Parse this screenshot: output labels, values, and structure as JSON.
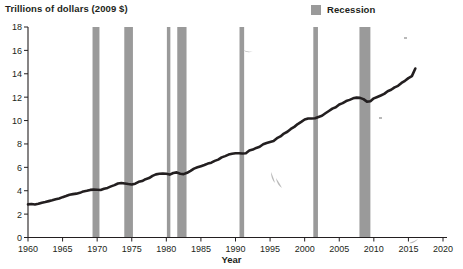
{
  "chart_data": {
    "type": "line",
    "title": "Trillions of dollars (2009 $)",
    "ylabel": "Trillions of dollars (2009 $)",
    "xlabel": "Year",
    "xlim": [
      1960,
      2020
    ],
    "ylim": [
      0,
      18
    ],
    "ytick_labels": [
      "0",
      "2",
      "4",
      "6",
      "8",
      "10",
      "12",
      "14",
      "16",
      "18"
    ],
    "yticks": [
      0,
      2,
      4,
      6,
      8,
      10,
      12,
      14,
      16,
      18
    ],
    "xtick_labels": [
      "1960",
      "1965",
      "1970",
      "1975",
      "1980",
      "1985",
      "1990",
      "1995",
      "2000",
      "2005",
      "2010",
      "2015",
      "2020"
    ],
    "xticks": [
      1960,
      1965,
      1970,
      1975,
      1980,
      1985,
      1990,
      1995,
      2000,
      2005,
      2010,
      2015,
      2020
    ],
    "grid": false,
    "legend_position": "top-right",
    "legend": [
      {
        "label": "Recession",
        "color": "#9a9a9a",
        "marker": "square"
      }
    ],
    "series": [
      {
        "name": "Real GDP",
        "color": "#231f20",
        "x": [
          1960,
          1960.5,
          1961,
          1961.5,
          1962,
          1962.5,
          1963,
          1963.5,
          1964,
          1964.5,
          1965,
          1965.5,
          1966,
          1966.5,
          1967,
          1967.5,
          1968,
          1968.5,
          1969,
          1969.5,
          1970,
          1970.5,
          1971,
          1971.5,
          1972,
          1972.5,
          1973,
          1973.5,
          1974,
          1974.5,
          1975,
          1975.5,
          1976,
          1976.5,
          1977,
          1977.5,
          1978,
          1978.5,
          1979,
          1979.5,
          1980,
          1980.5,
          1981,
          1981.5,
          1982,
          1982.5,
          1983,
          1983.5,
          1984,
          1984.5,
          1985,
          1985.5,
          1986,
          1986.5,
          1987,
          1987.5,
          1988,
          1988.5,
          1989,
          1989.5,
          1990,
          1990.5,
          1991,
          1991.5,
          1992,
          1992.5,
          1993,
          1993.5,
          1994,
          1994.5,
          1995,
          1995.5,
          1996,
          1996.5,
          1997,
          1997.5,
          1998,
          1998.5,
          1999,
          1999.5,
          2000,
          2000.5,
          2001,
          2001.5,
          2002,
          2002.5,
          2003,
          2003.5,
          2004,
          2004.5,
          2005,
          2005.5,
          2006,
          2006.5,
          2007,
          2007.5,
          2008,
          2008.5,
          2009,
          2009.5,
          2010,
          2010.5,
          2011,
          2011.5,
          2012,
          2012.5,
          2013,
          2013.5,
          2014,
          2014.5,
          2015,
          2015.5,
          2016
        ],
        "y": [
          2.83,
          2.86,
          2.82,
          2.88,
          2.98,
          3.04,
          3.11,
          3.18,
          3.27,
          3.34,
          3.45,
          3.55,
          3.66,
          3.71,
          3.75,
          3.82,
          3.94,
          4.0,
          4.07,
          4.09,
          4.08,
          4.06,
          4.17,
          4.24,
          4.37,
          4.48,
          4.62,
          4.66,
          4.62,
          4.57,
          4.53,
          4.6,
          4.76,
          4.83,
          4.99,
          5.08,
          5.27,
          5.4,
          5.45,
          5.47,
          5.45,
          5.38,
          5.52,
          5.57,
          5.45,
          5.42,
          5.53,
          5.7,
          5.89,
          6.0,
          6.1,
          6.2,
          6.32,
          6.4,
          6.55,
          6.66,
          6.85,
          6.96,
          7.09,
          7.16,
          7.21,
          7.21,
          7.18,
          7.21,
          7.44,
          7.52,
          7.66,
          7.76,
          7.97,
          8.08,
          8.17,
          8.25,
          8.49,
          8.64,
          8.89,
          9.04,
          9.28,
          9.46,
          9.7,
          9.89,
          10.09,
          10.18,
          10.17,
          10.2,
          10.31,
          10.41,
          10.62,
          10.82,
          11.02,
          11.14,
          11.38,
          11.49,
          11.67,
          11.77,
          11.9,
          11.96,
          11.94,
          11.83,
          11.62,
          11.65,
          11.9,
          12.02,
          12.14,
          12.28,
          12.51,
          12.63,
          12.84,
          12.97,
          13.22,
          13.4,
          13.63,
          13.8,
          14.45
        ]
      }
    ],
    "recessions": [
      {
        "start": 1969.33,
        "end": 1970.33
      },
      {
        "start": 1973.92,
        "end": 1975.17
      },
      {
        "start": 1980.08,
        "end": 1980.58
      },
      {
        "start": 1981.58,
        "end": 1982.92
      },
      {
        "start": 1990.58,
        "end": 1991.25
      },
      {
        "start": 2001.25,
        "end": 2001.92
      },
      {
        "start": 2007.92,
        "end": 2009.5
      }
    ],
    "axis_color": "#231f20",
    "line_color": "#231f20",
    "recession_color": "#9a9a9a"
  }
}
